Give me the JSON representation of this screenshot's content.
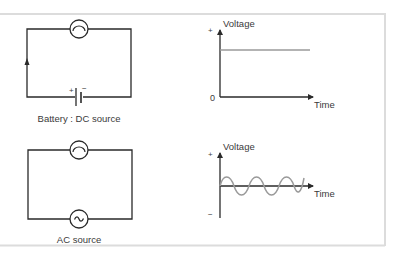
{
  "dc_panel": {
    "circuit_label": "Battery : DC source",
    "battery_plus": "+",
    "battery_minus": "−",
    "graph": {
      "y_label": "Voltage",
      "x_label": "Time",
      "y_plus": "+",
      "y_zero": "0"
    }
  },
  "ac_panel": {
    "circuit_label": "AC source",
    "source_glyph": "~",
    "graph": {
      "y_label": "Voltage",
      "x_label": "Time",
      "y_plus": "+",
      "y_minus": "−"
    }
  },
  "colors": {
    "frame": "#dcdcdc",
    "wire": "#2a2a2a",
    "signal": "#9a9a9a",
    "text": "#3a3a3a"
  }
}
